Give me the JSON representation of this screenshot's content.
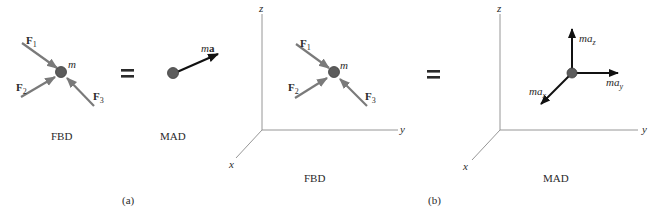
{
  "colors": {
    "force_arrow": "#7a7a7a",
    "accel_arrow": "#111111",
    "particle": "#5c5c5c",
    "axis": "#8a8a8a",
    "text": "#2a2a2a"
  },
  "panel_a": {
    "caption": "(a)",
    "fbd": {
      "label": "FBD",
      "mass_label": "m",
      "forces": [
        {
          "name": "F",
          "subscript": "1"
        },
        {
          "name": "F",
          "subscript": "2"
        },
        {
          "name": "F",
          "subscript": "3"
        }
      ]
    },
    "equals": "=",
    "mad": {
      "label": "MAD",
      "vector_label_m": "m",
      "vector_label_a": "a"
    }
  },
  "panel_b": {
    "caption": "(b)",
    "fbd": {
      "label": "FBD",
      "mass_label": "m",
      "axes": {
        "x": "x",
        "y": "y",
        "z": "z"
      },
      "forces": [
        {
          "name": "F",
          "subscript": "1"
        },
        {
          "name": "F",
          "subscript": "2"
        },
        {
          "name": "F",
          "subscript": "3"
        }
      ]
    },
    "equals": "=",
    "mad": {
      "label": "MAD",
      "axes": {
        "x": "x",
        "y": "y",
        "z": "z"
      },
      "components": [
        {
          "base": "ma",
          "subscript": "z"
        },
        {
          "base": "ma",
          "subscript": "y"
        },
        {
          "base": "ma",
          "subscript": "x"
        }
      ]
    }
  }
}
